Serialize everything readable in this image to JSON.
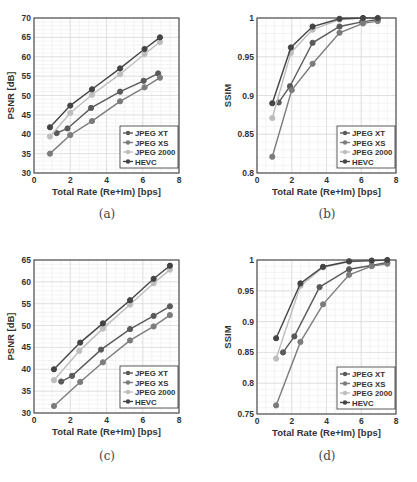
{
  "figure": {
    "captions": [
      "(a)",
      "(b)",
      "(c)",
      "(d)"
    ]
  },
  "series_styles": [
    {
      "name": "JPEG XT",
      "color": "#5a5a5a"
    },
    {
      "name": "JPEG XS",
      "color": "#7c7c7c"
    },
    {
      "name": "JPEG 2000",
      "color": "#bdbdbd"
    },
    {
      "name": "HEVC",
      "color": "#444444"
    }
  ],
  "chart_data": [
    {
      "id": "a",
      "type": "line",
      "title": "",
      "xlabel": "Total Rate (Re+Im) [bps]",
      "ylabel": "PSNR [dB]",
      "xlim": [
        0,
        8
      ],
      "ylim": [
        30,
        70
      ],
      "xticks": [
        0,
        2,
        4,
        6,
        8
      ],
      "yticks": [
        30,
        35,
        40,
        45,
        50,
        55,
        60,
        65,
        70
      ],
      "ytick_labels": [
        "30",
        "35",
        "40",
        "45",
        "50",
        "55",
        "60",
        "65",
        "70"
      ],
      "grid": true,
      "minor_grid": true,
      "legend_position": "lower right",
      "series": [
        {
          "name": "JPEG XT",
          "x": [
            1.25,
            1.85,
            3.15,
            4.75,
            6.05,
            6.85
          ],
          "y": [
            40.3,
            41.5,
            46.8,
            51.0,
            53.8,
            55.7
          ]
        },
        {
          "name": "JPEG XS",
          "x": [
            0.88,
            2.0,
            3.2,
            4.75,
            6.1,
            6.95
          ],
          "y": [
            35.0,
            39.8,
            43.4,
            48.5,
            52.1,
            54.6
          ]
        },
        {
          "name": "JPEG 2000",
          "x": [
            0.88,
            2.0,
            3.2,
            4.75,
            6.1,
            6.95
          ],
          "y": [
            39.4,
            45.5,
            50.2,
            55.5,
            60.7,
            63.8
          ]
        },
        {
          "name": "HEVC",
          "x": [
            0.88,
            2.0,
            3.2,
            4.75,
            6.1,
            6.95
          ],
          "y": [
            41.8,
            47.4,
            51.6,
            57.0,
            62.0,
            65.0
          ]
        }
      ]
    },
    {
      "id": "b",
      "type": "line",
      "title": "",
      "xlabel": "Total Rate (Re+Im) [bps]",
      "ylabel": "SSIM",
      "xlim": [
        0,
        8
      ],
      "ylim": [
        0.8,
        1.0
      ],
      "xticks": [
        0,
        2,
        4,
        6,
        8
      ],
      "yticks": [
        0.8,
        0.85,
        0.9,
        0.95,
        1.0
      ],
      "ytick_labels": [
        "0.8",
        "0.85",
        "0.9",
        "0.95",
        "1"
      ],
      "grid": true,
      "minor_grid": true,
      "legend_position": "lower right",
      "series": [
        {
          "name": "JPEG XT",
          "x": [
            1.25,
            1.9,
            3.2,
            4.75,
            6.05,
            6.95
          ],
          "y": [
            0.891,
            0.912,
            0.968,
            0.989,
            0.995,
            0.998
          ]
        },
        {
          "name": "JPEG XS",
          "x": [
            0.88,
            2.0,
            3.2,
            4.75,
            6.1,
            6.95
          ],
          "y": [
            0.821,
            0.907,
            0.941,
            0.981,
            0.993,
            0.996
          ]
        },
        {
          "name": "JPEG 2000",
          "x": [
            0.88,
            1.95,
            3.2,
            4.75,
            6.1,
            6.95
          ],
          "y": [
            0.871,
            0.955,
            0.985,
            0.998,
            1.0,
            1.0
          ]
        },
        {
          "name": "HEVC",
          "x": [
            0.88,
            1.95,
            3.2,
            4.75,
            6.1,
            6.95
          ],
          "y": [
            0.89,
            0.962,
            0.989,
            0.999,
            1.0,
            1.0
          ]
        }
      ]
    },
    {
      "id": "c",
      "type": "line",
      "title": "",
      "xlabel": "Total Rate (Re+Im) [bps]",
      "ylabel": "PSNR [dB]",
      "xlim": [
        0,
        8
      ],
      "ylim": [
        30,
        65
      ],
      "xticks": [
        0,
        2,
        4,
        6,
        8
      ],
      "yticks": [
        30,
        35,
        40,
        45,
        50,
        55,
        60,
        65
      ],
      "ytick_labels": [
        "30",
        "35",
        "40",
        "45",
        "50",
        "55",
        "60",
        "65"
      ],
      "grid": true,
      "minor_grid": true,
      "legend_position": "lower right",
      "series": [
        {
          "name": "JPEG XT",
          "x": [
            1.5,
            2.1,
            3.7,
            5.3,
            6.6,
            7.5
          ],
          "y": [
            37.2,
            38.5,
            44.5,
            49.2,
            52.2,
            54.4
          ]
        },
        {
          "name": "JPEG XS",
          "x": [
            1.1,
            2.55,
            3.8,
            5.3,
            6.6,
            7.5
          ],
          "y": [
            31.6,
            37.1,
            41.6,
            46.6,
            49.8,
            52.4
          ]
        },
        {
          "name": "JPEG 2000",
          "x": [
            1.1,
            2.5,
            3.8,
            5.3,
            6.6,
            7.5
          ],
          "y": [
            37.5,
            44.2,
            49.3,
            54.8,
            59.7,
            62.8
          ]
        },
        {
          "name": "HEVC",
          "x": [
            1.1,
            2.55,
            3.8,
            5.3,
            6.6,
            7.5
          ],
          "y": [
            40.0,
            46.1,
            50.5,
            55.8,
            60.7,
            63.7
          ]
        }
      ]
    },
    {
      "id": "d",
      "type": "line",
      "title": "",
      "xlabel": "Total Rate (Re+Im) [bps]",
      "ylabel": "SSIM",
      "xlim": [
        0,
        8
      ],
      "ylim": [
        0.75,
        1.0
      ],
      "xticks": [
        0,
        2,
        4,
        6,
        8
      ],
      "yticks": [
        0.75,
        0.8,
        0.85,
        0.9,
        0.95,
        1.0
      ],
      "ytick_labels": [
        "0.75",
        "0.8",
        "0.85",
        "0.9",
        "0.95",
        "1"
      ],
      "grid": true,
      "minor_grid": true,
      "legend_position": "lower right",
      "series": [
        {
          "name": "JPEG XT",
          "x": [
            1.5,
            2.15,
            3.6,
            5.3,
            6.6,
            7.5
          ],
          "y": [
            0.85,
            0.876,
            0.956,
            0.985,
            0.991,
            0.996
          ]
        },
        {
          "name": "JPEG XS",
          "x": [
            1.1,
            2.5,
            3.8,
            5.3,
            6.6,
            7.5
          ],
          "y": [
            0.764,
            0.867,
            0.928,
            0.976,
            0.99,
            0.994
          ]
        },
        {
          "name": "JPEG 2000",
          "x": [
            1.1,
            2.5,
            3.8,
            5.3,
            6.6,
            7.5
          ],
          "y": [
            0.84,
            0.958,
            0.988,
            0.997,
            0.999,
            1.0
          ]
        },
        {
          "name": "HEVC",
          "x": [
            1.1,
            2.5,
            3.8,
            5.3,
            6.6,
            7.5
          ],
          "y": [
            0.873,
            0.962,
            0.989,
            0.998,
            0.999,
            1.0
          ]
        }
      ]
    }
  ]
}
